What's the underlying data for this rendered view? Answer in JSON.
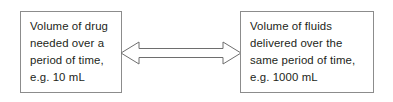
{
  "diagram": {
    "type": "relationship-diagram",
    "background_color": "#ffffff",
    "line_color": "#8c8c8c",
    "text_color": "#231f20",
    "left_box": {
      "text": "Volume of drug\nneeded over a\nperiod of time,\ne.g. 10 mL",
      "lines": [
        "Volume of drug",
        "needed over a",
        "period of time,",
        "e.g. 10 mL"
      ],
      "quantity": "10 mL"
    },
    "right_box": {
      "text": "Volume of fluids\ndelivered over the\nsame period of time,\ne.g. 1000 mL",
      "lines": [
        "Volume of fluids",
        "delivered over the",
        "same period of time,",
        "e.g. 1000 mL"
      ],
      "quantity": "1000 mL"
    },
    "connector": {
      "icon": "double-headed-arrow-icon",
      "style": "hollow-outline",
      "direction": "bidirectional"
    }
  }
}
